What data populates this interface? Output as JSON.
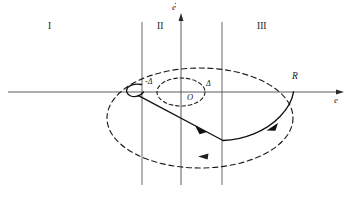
{
  "figure": {
    "background_color": "#ffffff",
    "stroke_color": "#1a1a1a",
    "width": 354,
    "height": 197
  },
  "axes": {
    "horizontal": {
      "name": "e-axis",
      "label": "e",
      "y": 92,
      "x_start": 8,
      "x_end": 344,
      "arrow": "right"
    },
    "vertical": {
      "name": "edot-axis",
      "label": "e",
      "accent": "dot",
      "x": 181,
      "y_start": 185,
      "y_end": 14,
      "arrow": "up"
    }
  },
  "switching_lines": [
    {
      "name": "left-switching-line",
      "x": 142,
      "y_top": 22,
      "y_bottom": 185
    },
    {
      "name": "right-switching-line",
      "x": 222,
      "y_top": 22,
      "y_bottom": 185
    }
  ],
  "regions": [
    {
      "name": "region-I",
      "label": "I",
      "x": 48,
      "y": 22
    },
    {
      "name": "region-II",
      "label": "II",
      "x": 157,
      "y": 22
    },
    {
      "name": "region-III",
      "label": "III",
      "x": 257,
      "y": 22
    }
  ],
  "markers": {
    "origin": {
      "label": "O",
      "x": 187,
      "y": 95
    },
    "terminal_point": {
      "label": "R",
      "x": 292,
      "y": 78
    },
    "delta_positive": {
      "label": "Δ",
      "x": 206,
      "y": 82
    },
    "delta_negative": {
      "label": "-Δ",
      "x": 146,
      "y": 80
    }
  },
  "curves": {
    "inner_dashed_ellipse": {
      "name": "inner-dead-zone-ellipse",
      "style": "dashed",
      "cx": 181,
      "cy": 92,
      "rx": 24,
      "ry": 14
    },
    "outer_dashed_ellipse": {
      "name": "outer-limit-cycle-ellipse",
      "style": "dashed",
      "cx": 200,
      "cy": 118,
      "rx": 93,
      "ry": 50,
      "arrow_direction": "counter-clockwise"
    },
    "solid_trajectory": {
      "name": "solid-trajectory-path",
      "style": "solid",
      "description": "spiral trajectory with hook near -delta, straight segment down-right, corner, then arc up to R",
      "arrow_count": 2
    }
  },
  "arrows": [
    {
      "name": "trajectory-arrow-segment",
      "x": 202,
      "y": 128,
      "direction": "down-right"
    },
    {
      "name": "trajectory-arrow-arc",
      "x": 272,
      "y": 127,
      "direction": "up-right"
    },
    {
      "name": "dashed-ellipse-arrow",
      "x": 205,
      "y": 157,
      "direction": "left"
    }
  ]
}
